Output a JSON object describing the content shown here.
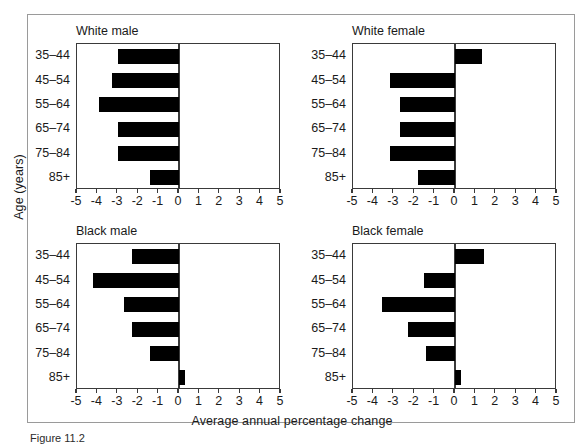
{
  "figure": {
    "xlabel": "Average annual percentage change",
    "ylabel": "Age (years)",
    "caption": "Figure 11.2"
  },
  "axis": {
    "xmin": -5,
    "xmax": 5,
    "ticks": [
      "-5",
      "-4",
      "-3",
      "-2",
      "-1",
      "0",
      "1",
      "2",
      "3",
      "4",
      "5"
    ],
    "tick_values": [
      -5,
      -4,
      -3,
      -2,
      -1,
      0,
      1,
      2,
      3,
      4,
      5
    ],
    "categories": [
      "35–44",
      "45–54",
      "55–64",
      "65–74",
      "75–84",
      "85+"
    ]
  },
  "panels": [
    {
      "title": "White male"
    },
    {
      "title": "White female"
    },
    {
      "title": "Black male"
    },
    {
      "title": "Black female"
    }
  ],
  "chart_data": {
    "type": "bar",
    "title": "",
    "xlabel": "Average annual percentage change",
    "ylabel": "Age (years)",
    "xlim": [
      -5,
      5
    ],
    "grid": false,
    "legend": "none",
    "orientation": "horizontal",
    "categories": [
      "35–44",
      "45–54",
      "55–64",
      "65–74",
      "75–84",
      "85+"
    ],
    "panels": [
      {
        "title": "White male",
        "values": [
          -3.0,
          -3.3,
          -3.9,
          -3.0,
          -3.0,
          -1.4
        ]
      },
      {
        "title": "White female",
        "values": [
          1.3,
          -3.2,
          -2.7,
          -2.7,
          -3.2,
          -1.8
        ]
      },
      {
        "title": "Black male",
        "values": [
          -2.3,
          -4.2,
          -2.7,
          -2.3,
          -1.4,
          0.3
        ]
      },
      {
        "title": "Black female",
        "values": [
          1.4,
          -1.5,
          -3.6,
          -2.3,
          -1.4,
          0.3
        ]
      }
    ]
  },
  "colors": {
    "bar": "#000000",
    "axis": "#3a3a3a",
    "frame": "#9a9a9a",
    "background": "#ffffff"
  }
}
